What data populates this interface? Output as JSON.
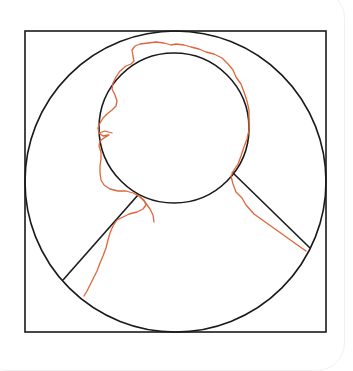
{
  "diagram": {
    "colors": {
      "background": "#ffffff",
      "guide_stroke": "#1a1a1a",
      "trace_stroke": "#e0653a",
      "panel_edge": "#f1f1f1"
    },
    "shapes": {
      "frame_square": {
        "x": 25,
        "y": 31,
        "width": 301,
        "height": 301
      },
      "outer_circle": {
        "cx": 175.5,
        "cy": 181.5,
        "r": 150.5
      },
      "head_circle": {
        "cx": 174,
        "cy": 128,
        "r": 75
      },
      "left_shoulder_line": {
        "x1": 138,
        "y1": 195,
        "x2": 63,
        "y2": 280
      },
      "right_shoulder_line": {
        "x1": 232,
        "y1": 172,
        "x2": 310,
        "y2": 248
      }
    },
    "trace_label": "hand-drawn silhouette outline"
  }
}
